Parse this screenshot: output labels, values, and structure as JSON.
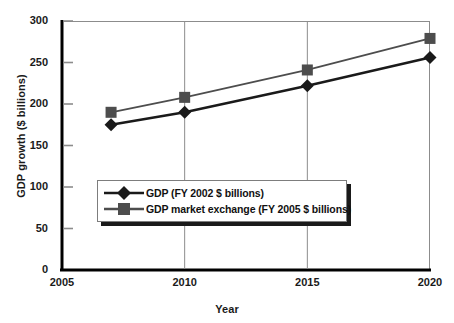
{
  "chart_data": {
    "type": "line",
    "title": "",
    "xlabel": "Year",
    "ylabel": "GDP growth ($ billions)",
    "x": [
      2007,
      2010,
      2015,
      2020
    ],
    "xlim": [
      2005,
      2020
    ],
    "ylim": [
      0,
      300
    ],
    "xticks": [
      "2005",
      "2010",
      "2015",
      "2020"
    ],
    "yticks": [
      "0",
      "50",
      "100",
      "150",
      "200",
      "250",
      "300"
    ],
    "grid": false,
    "legend_position": "center-left",
    "series": [
      {
        "name": "GDP (FY 2002 $ billions)",
        "marker": "diamond",
        "color": "#1a1a1a",
        "values": [
          175,
          190,
          222,
          256
        ]
      },
      {
        "name": "GDP market exchange (FY 2005 $ billions)",
        "marker": "square",
        "color": "#4d4d4d",
        "values": [
          190,
          208,
          241,
          279
        ]
      }
    ]
  },
  "axes": {
    "y_title": "GDP growth ($ billions)",
    "x_title": "Year"
  },
  "legend": {
    "entries": [
      {
        "label": "GDP (FY 2002 $ billions)",
        "marker": "diamond-marker"
      },
      {
        "label": "GDP market exchange (FY 2005 $ billions)",
        "marker": "square-marker"
      }
    ]
  },
  "colors": {
    "series_1": "#1a1a1a",
    "series_2": "#4d4d4d",
    "axis": "#000000",
    "frame": "#8c8c8c",
    "background": "#ffffff"
  }
}
